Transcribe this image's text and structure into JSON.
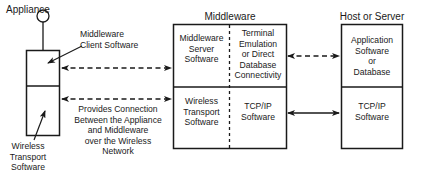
{
  "diagram": {
    "type": "architecture",
    "appliance": {
      "title": "Appliance",
      "callout_top": "Middleware\nClient Software",
      "callout_bottom": "Wireless\nTransport\nSoftware"
    },
    "link_note": "Provides Connection\nBetween the Appliance\nand Middleware\nover the Wireless\nNetwork",
    "middleware": {
      "title": "Middleware",
      "cells": {
        "top_left": "Middleware\nServer\nSoftware",
        "top_right": "Terminal\nEmulation\nor Direct\nDatabase\nConnectivity",
        "bottom_left": "Wireless\nTransport\nSoftware",
        "bottom_right": "TCP/IP\nSoftware"
      }
    },
    "host": {
      "title": "Host or Server",
      "cells": {
        "top": "Application\nSoftware\nor\nDatabase",
        "bottom": "TCP/IP\nSoftware"
      }
    },
    "connections": [
      {
        "from": "appliance.top",
        "to": "middleware.top_left",
        "style": "dashed",
        "direction": "both"
      },
      {
        "from": "appliance.bottom",
        "to": "middleware.bottom_left",
        "style": "dashed",
        "direction": "both"
      },
      {
        "from": "middleware.top_right",
        "to": "host.top",
        "style": "dashed",
        "direction": "both"
      },
      {
        "from": "middleware.bottom_right",
        "to": "host.bottom",
        "style": "solid",
        "direction": "both"
      }
    ],
    "colors": {
      "line": "#1a1a1a",
      "background": "#ffffff"
    }
  }
}
